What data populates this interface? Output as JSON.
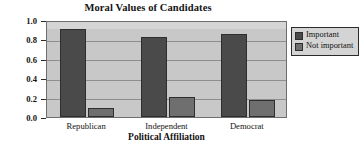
{
  "chart_data": {
    "type": "bar",
    "title": "Moral Values of Candidates",
    "xlabel": "Political Affiliation",
    "ylabel": "Relative Frequency",
    "categories": [
      "Republican",
      "Independent",
      "Democrat"
    ],
    "series": [
      {
        "name": "Important",
        "values": [
          0.91,
          0.82,
          0.86
        ],
        "color": "#4a4a4a"
      },
      {
        "name": "Not important",
        "values": [
          0.09,
          0.21,
          0.18
        ],
        "color": "#6f6f6f"
      }
    ],
    "ylim": [
      0.0,
      1.0
    ],
    "ytick_labels": [
      "1.0",
      "0.8",
      "0.6",
      "0.4",
      "0.2",
      "0.0"
    ],
    "ytick_values": [
      1.0,
      0.8,
      0.6,
      0.4,
      0.2,
      0.0
    ],
    "grid": true,
    "legend_position": "right",
    "plot_background": "#c8c8c8",
    "legend_background": "#d4d4d4"
  },
  "legend": {
    "entries": [
      {
        "label": "Important"
      },
      {
        "label": "Not important"
      }
    ]
  }
}
